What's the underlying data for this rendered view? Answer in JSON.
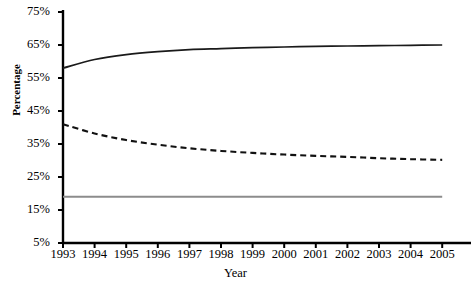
{
  "chart_data": {
    "type": "line",
    "title": "",
    "xlabel": "Year",
    "ylabel": "Percentage",
    "x": [
      1993,
      1994,
      1995,
      1996,
      1997,
      1998,
      1999,
      2000,
      2001,
      2002,
      2003,
      2004,
      2005
    ],
    "categories": [
      "1993",
      "1994",
      "1995",
      "1996",
      "1997",
      "1998",
      "1999",
      "2000",
      "2001",
      "2002",
      "2003",
      "2004",
      "2005"
    ],
    "xlim": [
      1993,
      2005
    ],
    "ylim": [
      5,
      75
    ],
    "yticks": [
      5,
      15,
      25,
      35,
      45,
      55,
      65,
      75
    ],
    "ytick_labels": [
      "5%",
      "15%",
      "25%",
      "35%",
      "45%",
      "55%",
      "65%",
      "75%"
    ],
    "grid": false,
    "legend": "none",
    "note": "Right-most x tick label is clipped by the image edge, rendering as '200'",
    "series": [
      {
        "name": "solid-series",
        "style": "solid",
        "color": "#1a1a1a",
        "width": 1.7,
        "values": [
          58.0,
          60.6,
          62.1,
          63.0,
          63.6,
          63.9,
          64.2,
          64.4,
          64.6,
          64.7,
          64.8,
          64.9,
          65.0
        ]
      },
      {
        "name": "dashed-series",
        "style": "dashed",
        "color": "#111111",
        "width": 2.1,
        "values": [
          41.0,
          38.2,
          36.2,
          34.8,
          33.7,
          32.9,
          32.3,
          31.8,
          31.4,
          31.1,
          30.7,
          30.4,
          30.2
        ]
      },
      {
        "name": "grey-flat-series",
        "style": "solid",
        "color": "#8c8c8c",
        "width": 2.0,
        "values": [
          19.0,
          19.0,
          19.0,
          19.0,
          19.0,
          19.0,
          19.0,
          19.0,
          19.0,
          19.0,
          19.0,
          19.0,
          19.0
        ]
      }
    ]
  },
  "axis": {
    "color": "#000000"
  }
}
